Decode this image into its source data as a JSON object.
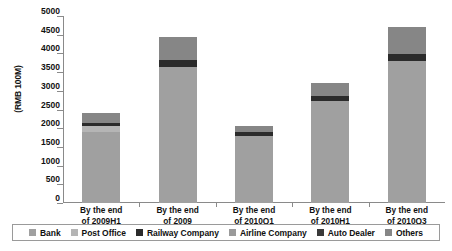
{
  "chart_data": {
    "type": "bar",
    "subtype": "stacked-vertical",
    "title": "",
    "xlabel": "",
    "ylabel": "(RMB 100M)",
    "ylim": [
      0,
      5000
    ],
    "yticks": [
      0,
      500,
      1000,
      1500,
      2000,
      2500,
      3000,
      3500,
      4000,
      4500,
      5000
    ],
    "ytick_labels": [
      "0",
      "500",
      "1000",
      "1500",
      "2000",
      "2500",
      "3000",
      "3500",
      "4000",
      "4500",
      "5000"
    ],
    "grid": false,
    "legend_position": "bottom",
    "categories": [
      "By the end of 2009H1",
      "By the end of 2009",
      "By the end of 2010Q1",
      "By the end of 2010H1",
      "By the end of 2010Q3"
    ],
    "category_lines": [
      [
        "By the end",
        "of 2009H1"
      ],
      [
        "By the end",
        "of 2009"
      ],
      [
        "By the end",
        "of 2010Q1"
      ],
      [
        "By the end",
        "of 2010H1"
      ],
      [
        "By the end",
        "of 2010Q3"
      ]
    ],
    "series": [
      {
        "name": "Bank",
        "color": "#a0a0a0",
        "values": [
          1900,
          3650,
          1800,
          2720,
          3790
        ]
      },
      {
        "name": "Post Office",
        "color": "#b5b5b5",
        "values": [
          150,
          0,
          0,
          0,
          0
        ]
      },
      {
        "name": "Railway Company",
        "color": "#2b2b2b",
        "values": [
          100,
          180,
          100,
          150,
          200
        ]
      },
      {
        "name": "Airline Company",
        "color": "#9a9a9a",
        "values": [
          0,
          0,
          0,
          0,
          0
        ]
      },
      {
        "name": "Auto Dealer",
        "color": "#3a3a3a",
        "values": [
          0,
          0,
          0,
          0,
          0
        ]
      },
      {
        "name": "Others",
        "color": "#868686",
        "values": [
          270,
          600,
          150,
          330,
          710
        ]
      }
    ],
    "totals": [
      2420,
      4430,
      2050,
      3200,
      4700
    ],
    "legend": [
      {
        "label": "Bank",
        "color": "#a0a0a0"
      },
      {
        "label": "Post Office",
        "color": "#b5b5b5"
      },
      {
        "label": "Railway Company",
        "color": "#2b2b2b"
      },
      {
        "label": "Airline Company",
        "color": "#9a9a9a"
      },
      {
        "label": "Auto Dealer",
        "color": "#3a3a3a"
      },
      {
        "label": "Others",
        "color": "#868686"
      }
    ],
    "axis_color": "#8a8a8a"
  }
}
